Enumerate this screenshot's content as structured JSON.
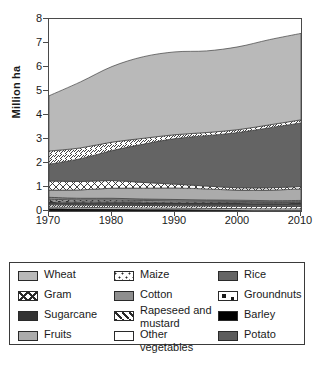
{
  "chart_data": {
    "type": "area",
    "title": "",
    "xlabel": "",
    "ylabel": "Million ha",
    "xlim": [
      1970,
      2010
    ],
    "ylim": [
      0,
      8
    ],
    "grid": false,
    "stacked": true,
    "legend_position": "below",
    "x": [
      1970,
      1975,
      1980,
      1985,
      1990,
      1995,
      2000,
      2005,
      2010
    ],
    "xticks": [
      "1970",
      "1980",
      "1990",
      "2000",
      "2010"
    ],
    "yticks": [
      "0",
      "1",
      "2",
      "3",
      "4",
      "5",
      "6",
      "7",
      "8"
    ],
    "series": [
      {
        "name": "Barley",
        "color": "#000000",
        "pattern": "solid",
        "values": [
          0.1,
          0.09,
          0.08,
          0.07,
          0.06,
          0.05,
          0.04,
          0.03,
          0.03
        ]
      },
      {
        "name": "Other vegetables",
        "color": "#ffffff",
        "pattern": "plain",
        "values": [
          0.06,
          0.06,
          0.06,
          0.06,
          0.06,
          0.06,
          0.06,
          0.06,
          0.06
        ]
      },
      {
        "name": "Rapeseed and mustard",
        "color": "#ffffff",
        "pattern": "diagonal",
        "values": [
          0.1,
          0.1,
          0.1,
          0.1,
          0.1,
          0.1,
          0.1,
          0.1,
          0.1
        ]
      },
      {
        "name": "Potato",
        "color": "#5c5c5c",
        "pattern": "solid",
        "values": [
          0.05,
          0.05,
          0.06,
          0.06,
          0.07,
          0.07,
          0.08,
          0.08,
          0.09
        ]
      },
      {
        "name": "Sugarcane",
        "color": "#333333",
        "pattern": "solid",
        "values": [
          0.07,
          0.06,
          0.06,
          0.06,
          0.05,
          0.05,
          0.05,
          0.05,
          0.05
        ]
      },
      {
        "name": "Groundnuts",
        "color": "#ffffff",
        "pattern": "blocks",
        "values": [
          0.05,
          0.05,
          0.05,
          0.04,
          0.04,
          0.04,
          0.03,
          0.03,
          0.03
        ]
      },
      {
        "name": "Maize",
        "color": "#ffffff",
        "pattern": "dotted",
        "values": [
          0.06,
          0.05,
          0.05,
          0.05,
          0.04,
          0.04,
          0.04,
          0.03,
          0.03
        ]
      },
      {
        "name": "Cotton",
        "color": "#8e8e8e",
        "pattern": "solid",
        "values": [
          0.08,
          0.07,
          0.07,
          0.06,
          0.06,
          0.05,
          0.05,
          0.05,
          0.05
        ]
      },
      {
        "name": "Fruits",
        "color": "#ababab",
        "pattern": "solid",
        "values": [
          0.3,
          0.35,
          0.42,
          0.45,
          0.48,
          0.46,
          0.42,
          0.44,
          0.48
        ]
      },
      {
        "name": "Gram",
        "color": "#ffffff",
        "pattern": "crosshatch",
        "values": [
          0.38,
          0.35,
          0.32,
          0.24,
          0.16,
          0.12,
          0.1,
          0.1,
          0.1
        ]
      },
      {
        "name": "Rice",
        "color": "#646464",
        "pattern": "solid",
        "values": [
          0.7,
          0.95,
          1.25,
          1.6,
          1.9,
          2.1,
          2.3,
          2.5,
          2.65
        ]
      },
      {
        "name": "Rapeseed band",
        "color": "#ffffff",
        "pattern": "diagonal",
        "values": [
          0.55,
          0.45,
          0.35,
          0.24,
          0.16,
          0.13,
          0.12,
          0.12,
          0.13
        ]
      },
      {
        "name": "Wheat",
        "color": "#b9b9b9",
        "pattern": "solid",
        "values": [
          2.3,
          2.75,
          3.15,
          3.4,
          3.45,
          3.4,
          3.45,
          3.55,
          3.6
        ]
      }
    ],
    "totals": [
      4.3,
      4.88,
      5.62,
      6.33,
      6.63,
      6.87,
      7.04,
      7.24,
      7.4
    ]
  },
  "axes": {
    "ylabel": "Million ha",
    "yticks": [
      "8",
      "7",
      "6",
      "5",
      "4",
      "3",
      "2",
      "1",
      "0"
    ],
    "xticks": [
      "1970",
      "1980",
      "1990",
      "2000",
      "2010"
    ]
  },
  "legend": {
    "columns": [
      [
        {
          "label": "Wheat",
          "swatch": "wheat-swatch"
        },
        {
          "label": "Gram",
          "swatch": "gram-swatch"
        },
        {
          "label": "Sugarcane",
          "swatch": "sugarcane-swatch"
        },
        {
          "label": "Fruits",
          "swatch": "fruits-swatch"
        }
      ],
      [
        {
          "label": "Maize",
          "swatch": "maize-swatch"
        },
        {
          "label": "Cotton",
          "swatch": "cotton-swatch"
        },
        {
          "label": "Rapeseed and\nmustard",
          "swatch": "rapeseed-swatch"
        },
        {
          "label": "Other vegetables",
          "swatch": "other-vegetables-swatch"
        }
      ],
      [
        {
          "label": "Rice",
          "swatch": "rice-swatch"
        },
        {
          "label": "Groundnuts",
          "swatch": "groundnuts-swatch"
        },
        {
          "label": "Barley",
          "swatch": "barley-swatch"
        },
        {
          "label": "Potato",
          "swatch": "potato-swatch"
        }
      ]
    ]
  }
}
